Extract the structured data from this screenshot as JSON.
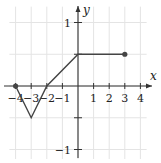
{
  "chart_data": {
    "type": "line",
    "title": "",
    "xlabel": "x",
    "ylabel": "y",
    "xlim": [
      -4.5,
      4.5
    ],
    "ylim": [
      -1.2,
      1.3
    ],
    "grid": true,
    "x_ticks": [
      -4,
      -3,
      -2,
      -1,
      1,
      2,
      3,
      4
    ],
    "x_tick_labels": [
      "−4",
      "−3",
      "−2",
      "−1",
      "1",
      "2",
      "3",
      "4"
    ],
    "y_ticks": [
      1,
      -1
    ],
    "y_tick_labels": [
      "1",
      "−1"
    ],
    "series": [
      {
        "name": "f(x)",
        "points": [
          [
            -4,
            0
          ],
          [
            -3,
            -0.5
          ],
          [
            -2,
            0
          ],
          [
            0,
            0.5
          ],
          [
            3,
            0.5
          ]
        ],
        "closed_endpoints": [
          [
            -4,
            0
          ],
          [
            3,
            0.5
          ]
        ]
      }
    ]
  },
  "labels": {
    "x_axis": "x",
    "y_axis": "y"
  }
}
